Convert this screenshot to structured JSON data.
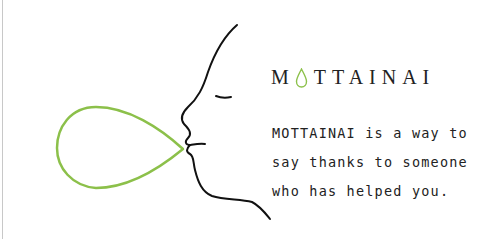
{
  "title": {
    "prefix": "M",
    "drop_letter_icon": "green-droplet-icon",
    "suffix": "TTAINAI",
    "full": "MOTTAINAI"
  },
  "description": {
    "lines": [
      "MOTTAINAI is a way to",
      "say thanks to someone",
      "who has helped you."
    ]
  },
  "colors": {
    "accent_green": "#8cc04a",
    "text": "#222222",
    "line": "#111111"
  },
  "illustration": {
    "face_icon": "face-profile-icon",
    "bubble_icon": "breath-droplet-icon"
  }
}
